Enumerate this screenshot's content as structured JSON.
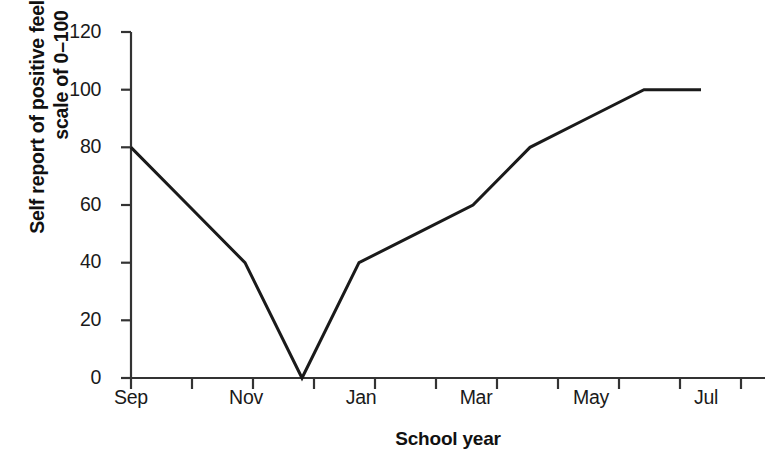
{
  "chart_data": {
    "type": "line",
    "title": "",
    "xlabel": "School year",
    "ylabel": "Self report of positive feelings on a\nscale of 0–100",
    "ylabel_lines": [
      "Self report of positive feelings on a",
      "scale of 0–100"
    ],
    "categories": [
      "Sep",
      "Oct",
      "Nov",
      "Dec",
      "Jan",
      "Feb",
      "Mar",
      "Apr",
      "May",
      "Jun",
      "Jul"
    ],
    "values": [
      80,
      60,
      40,
      0,
      40,
      50,
      60,
      80,
      90,
      100,
      100
    ],
    "x_tick_labels": [
      "Sep",
      "",
      "Nov",
      "",
      "Jan",
      "",
      "Mar",
      "",
      "May",
      "",
      "Jul"
    ],
    "x_major_labels": [
      "Sep",
      "Nov",
      "Jan",
      "Mar",
      "May",
      "Jul"
    ],
    "y_ticks": [
      0,
      20,
      40,
      60,
      80,
      100,
      120
    ],
    "ylim": [
      0,
      120
    ],
    "xlim": [
      "Sep",
      "Jul"
    ],
    "grid": false,
    "legend": "none",
    "series": [
      {
        "name": "Self report of positive feelings",
        "values": [
          80,
          60,
          40,
          0,
          40,
          50,
          60,
          80,
          90,
          100,
          100
        ],
        "color": "#1a1a1a",
        "line_width": 3
      }
    ],
    "colors": {
      "line": "#1a1a1a",
      "axis": "#333333",
      "background": "#ffffff",
      "text": "#1a1a1a"
    }
  },
  "axes": {
    "plot_left": 131,
    "plot_right": 765,
    "plot_bottom": 378,
    "y_top_value_px": 32,
    "tick_step_px": 57
  }
}
